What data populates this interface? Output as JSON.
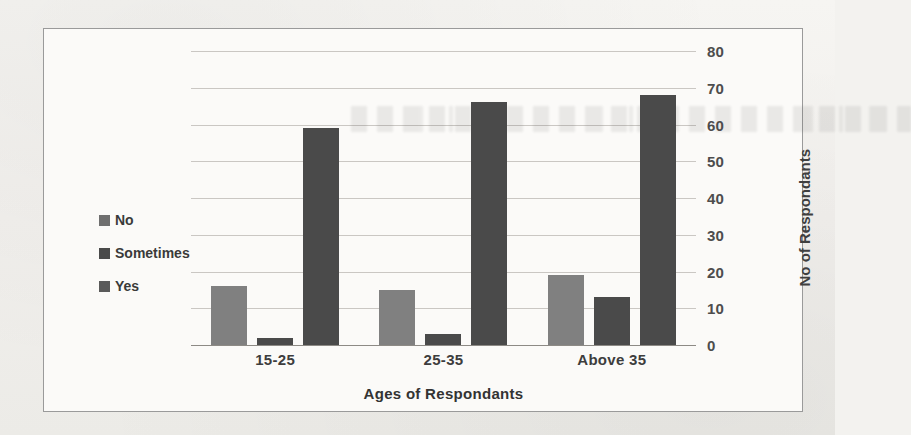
{
  "chart_data": {
    "type": "bar",
    "title": "",
    "subtitle": "",
    "xlabel": "Ages of Respondants",
    "ylabel": "No of Respondants",
    "categories": [
      "15-25",
      "25-35",
      "Above 35"
    ],
    "series": [
      {
        "name": "No",
        "values": [
          16,
          15,
          19
        ],
        "color": "#808080"
      },
      {
        "name": "Sometimes",
        "values": [
          2,
          3,
          13
        ],
        "color": "#4a4a4a"
      },
      {
        "name": "Yes",
        "values": [
          59,
          66,
          68
        ],
        "color": "#4a4a4a"
      }
    ],
    "ylim": [
      0,
      80
    ],
    "yticks": [
      0,
      10,
      20,
      30,
      40,
      50,
      60,
      70,
      80
    ],
    "ytick_labels": [
      "0",
      "10",
      "20",
      "30",
      "40",
      "50",
      "60",
      "70",
      "80"
    ],
    "y_axis_position": "right",
    "grid": true,
    "grid_axis": "y",
    "legend": {
      "position": "left",
      "entries": [
        {
          "label": "No",
          "marker": "square",
          "color": "#6f6f6f"
        },
        {
          "label": "Sometimes",
          "marker": "square",
          "color": "#4a4a4a"
        },
        {
          "label": "Yes",
          "marker": "square",
          "color": "#5a5a5a"
        }
      ]
    }
  },
  "colors": {
    "page_background": "#f3f2ef",
    "plot_background": "#fbfaf8",
    "frame_border": "#9a9a9a",
    "gridline": "#b9b6b1",
    "baseline": "#8d8a85",
    "text": "#3d3d3d",
    "bar_no": "#808080",
    "bar_sometimes": "#4a4a4a",
    "bar_yes": "#4a4a4a"
  }
}
